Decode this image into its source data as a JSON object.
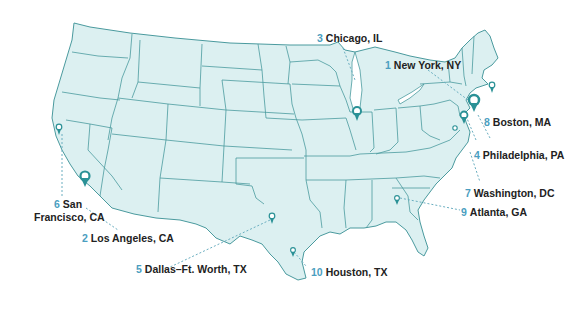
{
  "map": {
    "title": "Top 10 U.S. metro areas",
    "colors": {
      "land": "#dcf0f1",
      "border": "#4a9a9e",
      "pin": "#2a9196",
      "number": "#4a9ec0",
      "label": "#222222",
      "leader": "#6aaec0"
    },
    "cities": [
      {
        "rank": "1",
        "name": "New York, NY"
      },
      {
        "rank": "2",
        "name": "Los Angeles, CA"
      },
      {
        "rank": "3",
        "name": "Chicago, IL"
      },
      {
        "rank": "4",
        "name": "Philadelphia, PA"
      },
      {
        "rank": "5",
        "name": "Dallas–Ft. Worth, TX"
      },
      {
        "rank": "6",
        "name": "San",
        "name2": "Francisco, CA"
      },
      {
        "rank": "7",
        "name": "Washington, DC"
      },
      {
        "rank": "8",
        "name": "Boston, MA"
      },
      {
        "rank": "9",
        "name": "Atlanta, GA"
      },
      {
        "rank": "10",
        "name": "Houston, TX"
      }
    ]
  }
}
